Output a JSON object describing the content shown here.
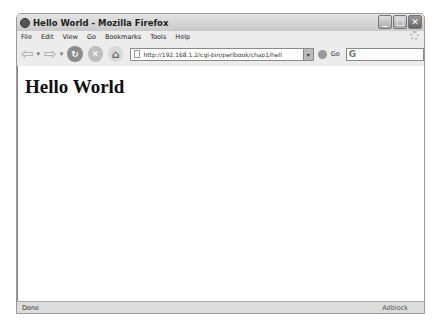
{
  "window": {
    "title": "Hello World - Mozilla Firefox",
    "controls": {
      "minimize": "_",
      "maximize": "□",
      "close": "✕"
    }
  },
  "menubar": {
    "items": [
      {
        "label": "File"
      },
      {
        "label": "Edit"
      },
      {
        "label": "View"
      },
      {
        "label": "Go"
      },
      {
        "label": "Bookmarks"
      },
      {
        "label": "Tools"
      },
      {
        "label": "Help"
      }
    ]
  },
  "navbar": {
    "back_icon": "⇦",
    "forward_icon": "⇨",
    "reload_icon": "↻",
    "stop_icon": "✕",
    "home_icon": "⌂",
    "url": "http://192.168.1.2/cgi-bin/perlbook/chap1/hell",
    "dropdown_icon": "▾",
    "go_label": "Go",
    "search_icon": "G"
  },
  "content": {
    "heading": "Hello World"
  },
  "statusbar": {
    "status": "Done",
    "adblock": "Adblock"
  }
}
